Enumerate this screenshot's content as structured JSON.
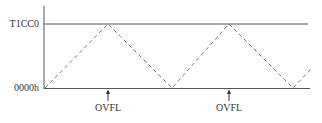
{
  "diagram": {
    "title": "",
    "y_labels": {
      "top": "T1CC0",
      "bottom": "0000h"
    },
    "events": [
      {
        "label": "OVFL",
        "x": 108
      },
      {
        "label": "OVFL",
        "x": 229
      }
    ],
    "waveform": {
      "style": "dashed",
      "shape": "triangle",
      "points": [
        [
          45,
          88
        ],
        [
          108,
          24
        ],
        [
          172,
          88
        ],
        [
          229,
          24
        ],
        [
          293,
          88
        ],
        [
          312,
          68
        ]
      ]
    },
    "colors": {
      "line": "#555555",
      "dash": "#777777",
      "text": "#333333"
    }
  }
}
